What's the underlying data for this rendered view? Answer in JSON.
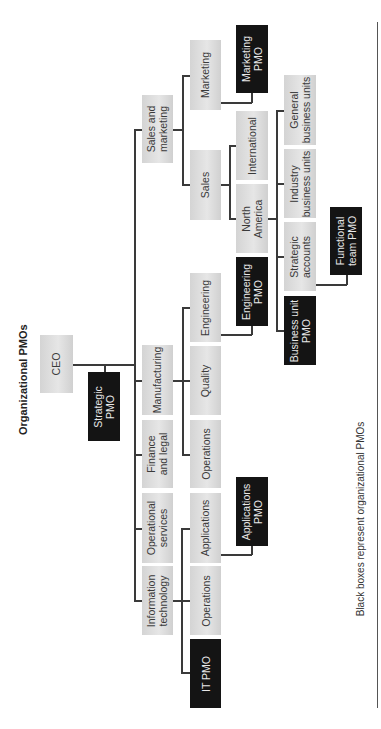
{
  "title": "Organizational PMOs",
  "footnote": "Black boxes represent organizational PMOs",
  "nodes": {
    "ceo": "CEO",
    "strategic_pmo": "Strategic\nPMO",
    "sales_marketing": "Sales and\nmarketing",
    "manufacturing": "Manufacturing",
    "finance_legal": "Finance\nand legal",
    "operational_services": "Operational\nservices",
    "information_technology": "Information\ntechnology",
    "marketing": "Marketing",
    "marketing_pmo": "Marketing\nPMO",
    "sales": "Sales",
    "international": "International",
    "north_america": "North\nAmerica",
    "general_business_units": "General\nbusiness units",
    "industry_business_units": "Industry\nbusiness units",
    "strategic_accounts": "Strategic\naccounts",
    "business_unit_pmo": "Business unit\nPMO",
    "functional_team_pmo": "Functional\nteam PMO",
    "engineering": "Engineering",
    "engineering_pmo": "Engineering\nPMO",
    "quality": "Quality",
    "mfg_operations": "Operations",
    "applications": "Applications",
    "applications_pmo": "Applications\nPMO",
    "it_operations": "Operations",
    "it_pmo": "IT PMO"
  },
  "legend": {
    "gray_box": "Organizational unit",
    "black_box": "Organizational PMO",
    "gray_color": "#dcdcdc",
    "black_color": "#141414"
  }
}
